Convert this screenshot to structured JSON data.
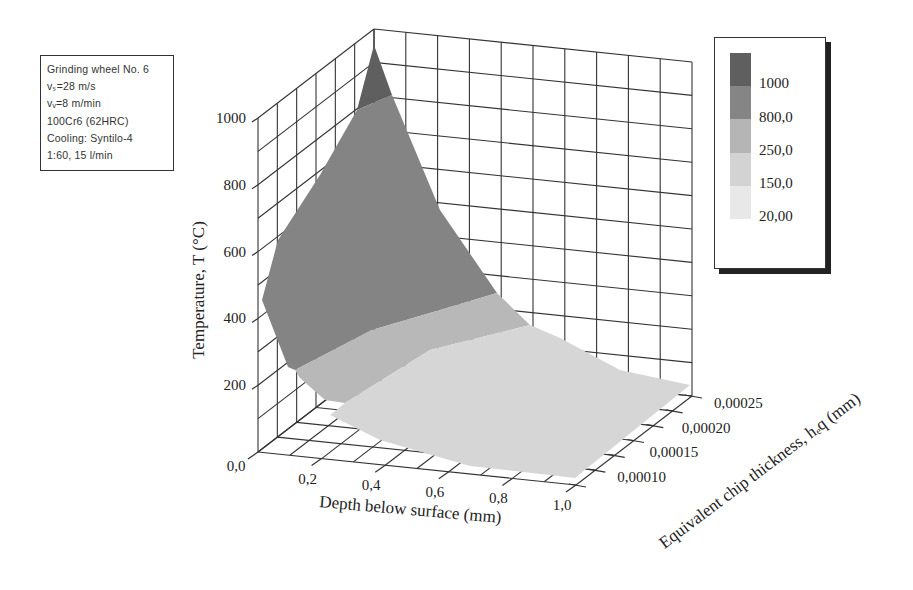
{
  "info_box": {
    "lines": [
      "Grinding wheel No. 6",
      "vₛ=28 m/s",
      "vᵥ=8 m/min",
      "100Cr6 (62HRC)",
      "Cooling: Syntilo-4",
      "1:60, 15 l/min"
    ]
  },
  "legend": {
    "entries": [
      {
        "label": "1000",
        "color": "#5a5a5a"
      },
      {
        "label": "800,0",
        "color": "#808080"
      },
      {
        "label": "250,0",
        "color": "#b4b4b4"
      },
      {
        "label": "150,0",
        "color": "#d2d2d2"
      },
      {
        "label": "20,00",
        "color": "#e6e6e6"
      }
    ]
  },
  "axes": {
    "z_label": "Temperature, T (°C)",
    "x_label": "Depth below surface (mm)",
    "y_label": "Equivalent chip thickness, hₑq (mm)",
    "z_ticks": [
      "200",
      "400",
      "600",
      "800",
      "1000"
    ],
    "x_ticks": [
      "0,0",
      "0,2",
      "0,4",
      "0,6",
      "0,8",
      "1,0"
    ],
    "y_ticks": [
      "0,00010",
      "0,00015",
      "0,00020",
      "0,00025"
    ]
  },
  "chart_data": {
    "type": "surface3d",
    "title": "",
    "xlabel": "Depth below surface (mm)",
    "ylabel": "Equivalent chip thickness, h_eq (mm)",
    "zlabel": "Temperature, T (°C)",
    "xlim": [
      0.0,
      1.0
    ],
    "ylim": [
      0.0001,
      0.00025
    ],
    "zlim": [
      0,
      1000
    ],
    "x_ticks": [
      0.0,
      0.2,
      0.4,
      0.6,
      0.8,
      1.0
    ],
    "y_ticks": [
      0.0001,
      0.00015,
      0.0002,
      0.00025
    ],
    "z_ticks": [
      200,
      400,
      600,
      800,
      1000
    ],
    "grid": true,
    "legend_position": "right",
    "color_levels": [
      {
        "min": 800,
        "max": 1000,
        "label": "1000"
      },
      {
        "min": 250,
        "max": 800,
        "label": "800,0"
      },
      {
        "min": 150,
        "max": 250,
        "label": "250,0"
      },
      {
        "min": 20,
        "max": 150,
        "label": "150,0"
      },
      {
        "min": 0,
        "max": 20,
        "label": "20,00"
      }
    ],
    "surface_points": [
      {
        "depth": 0.0,
        "h_eq": 0.00025,
        "T": 950
      },
      {
        "depth": 0.0,
        "h_eq": 0.0001,
        "T": 430
      },
      {
        "depth": 0.2,
        "h_eq": 0.00025,
        "T": 520
      },
      {
        "depth": 0.2,
        "h_eq": 0.0001,
        "T": 220
      },
      {
        "depth": 0.4,
        "h_eq": 0.00025,
        "T": 300
      },
      {
        "depth": 0.4,
        "h_eq": 0.0001,
        "T": 120
      },
      {
        "depth": 0.6,
        "h_eq": 0.00025,
        "T": 180
      },
      {
        "depth": 0.6,
        "h_eq": 0.0001,
        "T": 70
      },
      {
        "depth": 1.0,
        "h_eq": 0.00025,
        "T": 80
      },
      {
        "depth": 1.0,
        "h_eq": 0.0001,
        "T": 30
      }
    ],
    "annotations": [
      "Grinding wheel No. 6",
      "vs=28 m/s",
      "vw=8 m/min",
      "100Cr6 (62HRC)",
      "Cooling: Syntilo-4",
      "1:60, 15 l/min"
    ]
  }
}
